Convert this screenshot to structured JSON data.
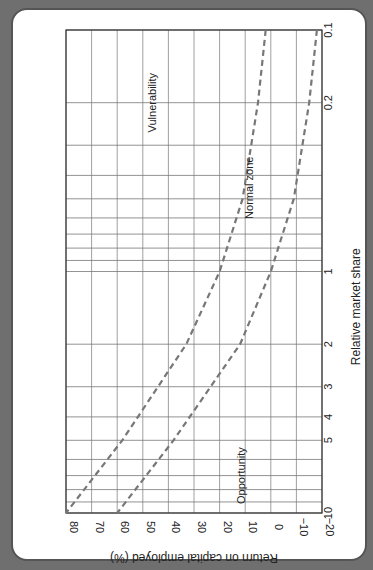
{
  "chart_data": {
    "type": "line",
    "orientation": "rotated-90",
    "title": "",
    "xlabel": "Relative market share",
    "ylabel": "Return on capital employed (%)",
    "x_scale": "log",
    "xlim": [
      0.1,
      10
    ],
    "ylim": [
      -20,
      80
    ],
    "x_ticks": [
      {
        "value": 0.1,
        "label": "0.1"
      },
      {
        "value": 0.2,
        "label": "0.2"
      },
      {
        "value": 1,
        "label": "1"
      },
      {
        "value": 2,
        "label": "2"
      },
      {
        "value": 3,
        "label": "3"
      },
      {
        "value": 4,
        "label": "4"
      },
      {
        "value": 5,
        "label": "5"
      },
      {
        "value": 10,
        "label": "10"
      }
    ],
    "x_gridlines": [
      0.1,
      0.2,
      0.3,
      0.4,
      0.5,
      0.6,
      0.7,
      0.8,
      0.9,
      1,
      2,
      3,
      4,
      5,
      6,
      7,
      8,
      9,
      10
    ],
    "y_ticks": [
      {
        "value": 80,
        "label": "80"
      },
      {
        "value": 70,
        "label": "70"
      },
      {
        "value": 60,
        "label": "60"
      },
      {
        "value": 50,
        "label": "50"
      },
      {
        "value": 40,
        "label": "40"
      },
      {
        "value": 30,
        "label": "30"
      },
      {
        "value": 20,
        "label": "20"
      },
      {
        "value": 10,
        "label": "10"
      },
      {
        "value": 0,
        "label": "0"
      },
      {
        "value": -10,
        "label": "−10"
      },
      {
        "value": -20,
        "label": "−20"
      }
    ],
    "grid": true,
    "series": [
      {
        "name": "Upper boundary",
        "style": "dashed",
        "x": [
          0.1,
          0.2,
          0.5,
          1,
          2,
          5,
          10
        ],
        "values": [
          2,
          5,
          11,
          20,
          33,
          58,
          80
        ]
      },
      {
        "name": "Lower boundary",
        "style": "dashed",
        "x": [
          0.1,
          0.2,
          0.5,
          1,
          2,
          5,
          10
        ],
        "values": [
          -18,
          -15,
          -9,
          0,
          12,
          38,
          60
        ]
      }
    ],
    "annotations": [
      {
        "text": "Vulnerability",
        "x": 0.2,
        "y": 45
      },
      {
        "text": "Normal zone",
        "x": 0.45,
        "y": 7
      },
      {
        "text": "Opportunity",
        "x": 7,
        "y": 10
      }
    ]
  }
}
